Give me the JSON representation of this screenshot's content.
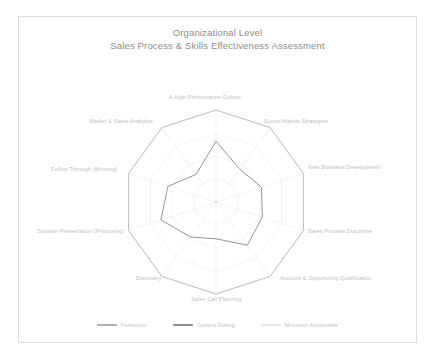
{
  "title": {
    "line1": "Organizational Level",
    "line2": "Sales Process & Skills Effectiveness Assessment"
  },
  "colors": {
    "perfection": "#b9b9b9",
    "current_rating": "#8f8f8f",
    "minimum_acceptable": "#d8d8d8",
    "grid": "#e3e3e3",
    "outer_ring": "#d0d0d0",
    "axis_label": "#bcbcbc",
    "title": "#8c8c8c",
    "sheet_border": "#dcdcdc",
    "background": "#ffffff"
  },
  "legend": {
    "items": [
      {
        "label": "Perfection",
        "color": "#b0b0b0",
        "name": "legend-perfection"
      },
      {
        "label": "Current Rating",
        "color": "#8f8f8f",
        "name": "legend-current-rating"
      },
      {
        "label": "Minimum Acceptable",
        "color": "#e6e6e6",
        "name": "legend-minimum-acceptable"
      }
    ]
  },
  "chart_data": {
    "type": "radar",
    "categories": [
      "A High Performance Culture",
      "Sound Market Strategies",
      "New Business Development",
      "Sales Process Discipline",
      "Account & Opportunity Qualification",
      "Sales Call Planning",
      "Discovery",
      "Solution Presentation (Proposing)",
      "Follow Through (Winning)",
      "Market & Sales Analytics"
    ],
    "rmin": 0,
    "rmax": 100,
    "grid": true,
    "legend_position": "bottom",
    "series": [
      {
        "name": "Perfection",
        "color": "#b9b9b9",
        "values": [
          100,
          100,
          100,
          100,
          100,
          100,
          100,
          100,
          100,
          100
        ]
      },
      {
        "name": "Current Rating",
        "color": "#8f8f8f",
        "values": [
          66,
          44,
          52,
          53,
          58,
          40,
          47,
          63,
          55,
          37
        ]
      },
      {
        "name": "Minimum Acceptable",
        "color": "#d8d8d8",
        "values": [
          0,
          0,
          0,
          0,
          0,
          0,
          0,
          0,
          0,
          0
        ]
      }
    ]
  },
  "geometry": {
    "center_x": 216,
    "center_y": 202,
    "outer_radius": 92,
    "ring_levels": [
      0.25,
      0.5,
      0.75,
      1.0
    ]
  },
  "axis_labels": [
    {
      "text": "A High Performance Culture",
      "left": 169,
      "top": 94
    },
    {
      "text": "Sound Market Strategies",
      "left": 264,
      "top": 118
    },
    {
      "text": "New Business Development",
      "left": 308,
      "top": 164
    },
    {
      "text": "Sales Process Discipline",
      "left": 308,
      "top": 228
    },
    {
      "text": "Account & Opportunity Qualification",
      "left": 280,
      "top": 275
    },
    {
      "text": "Sales Call Planning",
      "left": 191,
      "top": 296
    },
    {
      "text": "Discovery",
      "left": 136,
      "top": 275
    },
    {
      "text": "Solution Presentation (Proposing)",
      "left": 37,
      "top": 228
    },
    {
      "text": "Follow Through (Winning)",
      "left": 51,
      "top": 166
    },
    {
      "text": "Market & Sales Analytics",
      "left": 89,
      "top": 118
    }
  ]
}
